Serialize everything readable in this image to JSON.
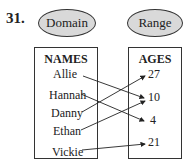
{
  "problem_number": "31.",
  "domain_label": "Domain",
  "range_label": "Range",
  "domain": {
    "header": "NAMES",
    "items": [
      "Allie",
      "Hannah",
      "Danny",
      "Ethan",
      "Vickie"
    ]
  },
  "range": {
    "header": "AGES",
    "items": [
      "27",
      "10",
      "4",
      "21"
    ]
  },
  "mappings": [
    {
      "from": "Allie",
      "to": "10"
    },
    {
      "from": "Hannah",
      "to": "4"
    },
    {
      "from": "Danny",
      "to": "27"
    },
    {
      "from": "Ethan",
      "to": "10"
    },
    {
      "from": "Vickie",
      "to": "21"
    }
  ],
  "colors": {
    "ellipse_fill": "#d9d9d9",
    "stroke": "#333333"
  }
}
